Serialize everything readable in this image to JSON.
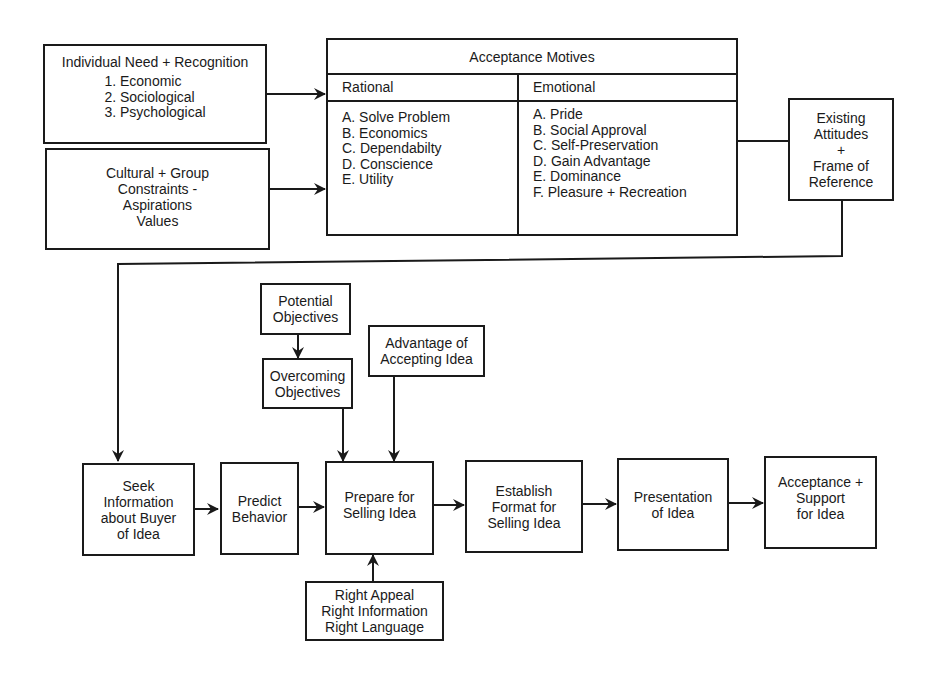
{
  "inputs": {
    "individual_need": {
      "title": "Individual Need + Recognition",
      "items": [
        "1.  Economic",
        "2.  Sociological",
        "3.  Psychological"
      ]
    },
    "cultural_group": {
      "lines": [
        "Cultural + Group",
        "Constraints -",
        "Aspirations",
        "Values"
      ]
    }
  },
  "acceptance_motives": {
    "title": "Acceptance Motives",
    "rational": {
      "heading": "Rational",
      "items": [
        "A.  Solve Problem",
        "B.  Economics",
        "C.  Dependabilty",
        "D.  Conscience",
        "E.  Utility"
      ]
    },
    "emotional": {
      "heading": "Emotional",
      "items": [
        "A. Pride",
        "B. Social Approval",
        "C. Self-Preservation",
        "D. Gain Advantage",
        "E.  Dominance",
        "F.  Pleasure + Recreation"
      ]
    }
  },
  "existing_attitudes": {
    "lines": [
      "Existing",
      "Attitudes",
      "+",
      "Frame of",
      "Reference"
    ]
  },
  "side_inputs": {
    "potential_objectives": {
      "lines": [
        "Potential",
        "Objectives"
      ]
    },
    "overcoming_objectives": {
      "lines": [
        "Overcoming",
        "Objectives"
      ]
    },
    "advantage": {
      "lines": [
        "Advantage of",
        "Accepting Idea"
      ]
    },
    "right_appeal": {
      "lines": [
        "Right Appeal",
        "Right Information",
        "Right Language"
      ]
    }
  },
  "process_steps": [
    {
      "lines": [
        "Seek",
        "Information",
        "about Buyer",
        "of Idea"
      ]
    },
    {
      "lines": [
        "Predict",
        "Behavior"
      ]
    },
    {
      "lines": [
        "Prepare for",
        "Selling Idea"
      ]
    },
    {
      "lines": [
        "Establish",
        "Format for",
        "Selling Idea"
      ]
    },
    {
      "lines": [
        "Presentation",
        "of Idea"
      ]
    },
    {
      "lines": [
        "Acceptance +",
        "Support",
        "for Idea"
      ]
    }
  ],
  "colors": {
    "ink": "#1a1a1a",
    "background": "#ffffff"
  }
}
